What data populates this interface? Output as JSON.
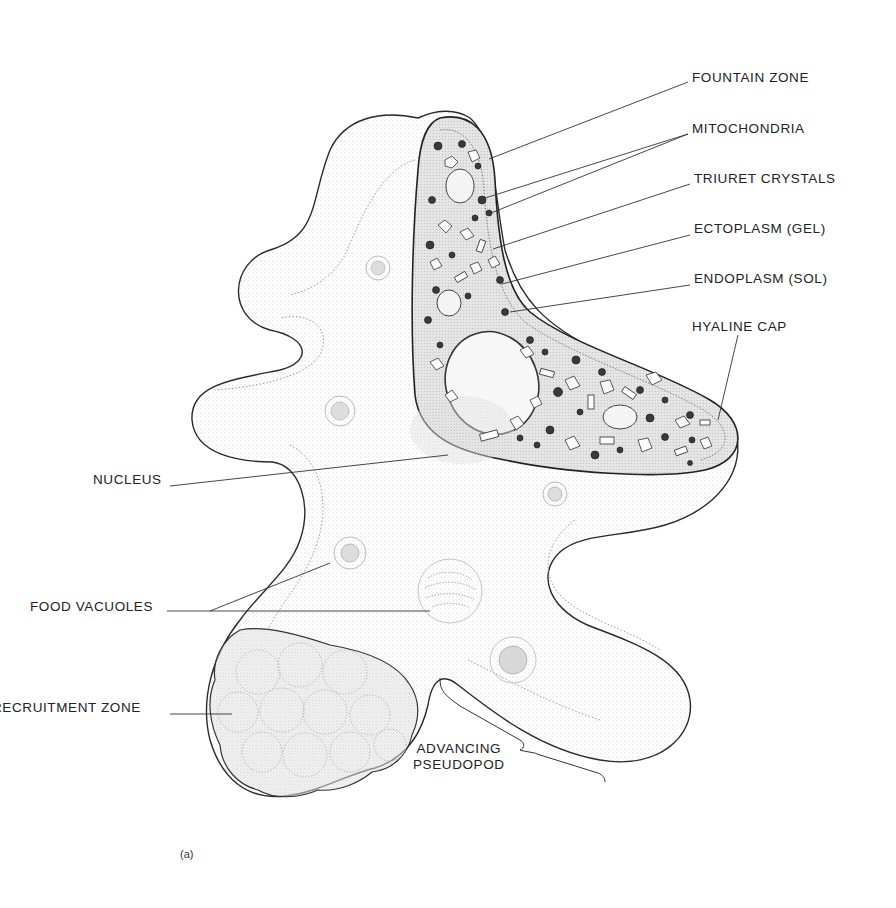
{
  "figure": {
    "caption": "(a)"
  },
  "labels": {
    "fountain_zone": "FOUNTAIN ZONE",
    "mitochondria": "MITOCHONDRIA",
    "triuret_crystals": "TRIURET CRYSTALS",
    "ectoplasm": "ECTOPLASM (GEL)",
    "endoplasm": "ENDOPLASM (SOL)",
    "hyaline_cap": "HYALINE CAP",
    "nucleus": "NUCLEUS",
    "food_vacuoles": "FOOD VACUOLES",
    "recruitment_zone": "RECRUITMENT ZONE",
    "advancing_pseudopod": "ADVANCING\nPSEUDOPOD"
  },
  "colors": {
    "ink": "#222222",
    "stipple": "#8a8a8a",
    "endoplasm_fill": "#e4e4e4",
    "background": "#ffffff"
  }
}
